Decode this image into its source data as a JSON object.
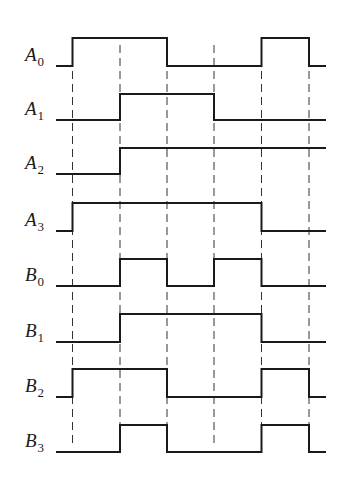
{
  "diagram": {
    "type": "timing-diagram",
    "edge_times_px": [
      72.5,
      120,
      167,
      214,
      261.5,
      309
    ],
    "x_start": 56,
    "x_end": 326,
    "dashed_line_top": 45,
    "dashed_line_bottom": 448,
    "signals": [
      {
        "name": "A",
        "sub": "0",
        "high_y": 38,
        "low_y": 66,
        "initial": 0,
        "states": [
          1,
          1,
          0,
          0,
          1,
          0
        ]
      },
      {
        "name": "A",
        "sub": "1",
        "high_y": 94,
        "low_y": 120,
        "initial": 0,
        "states": [
          0,
          1,
          1,
          0,
          0,
          0
        ]
      },
      {
        "name": "A",
        "sub": "2",
        "high_y": 148,
        "low_y": 174,
        "initial": 0,
        "states": [
          0,
          1,
          1,
          1,
          1,
          1
        ]
      },
      {
        "name": "A",
        "sub": "3",
        "high_y": 203,
        "low_y": 231,
        "initial": 0,
        "states": [
          1,
          1,
          1,
          1,
          0,
          0
        ]
      },
      {
        "name": "B",
        "sub": "0",
        "high_y": 259,
        "low_y": 286,
        "initial": 0,
        "states": [
          0,
          1,
          0,
          1,
          0,
          0
        ]
      },
      {
        "name": "B",
        "sub": "1",
        "high_y": 314,
        "low_y": 342,
        "initial": 0,
        "states": [
          0,
          1,
          1,
          1,
          0,
          0
        ]
      },
      {
        "name": "B",
        "sub": "2",
        "high_y": 369,
        "low_y": 397,
        "initial": 0,
        "states": [
          1,
          1,
          0,
          0,
          1,
          0
        ]
      },
      {
        "name": "B",
        "sub": "3",
        "high_y": 425,
        "low_y": 452,
        "initial": 0,
        "states": [
          0,
          1,
          0,
          0,
          1,
          0
        ]
      }
    ]
  }
}
